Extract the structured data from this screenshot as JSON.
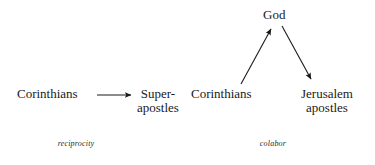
{
  "figure": {
    "width": 375,
    "height": 165,
    "background": "#ffffff",
    "text_color": "#1a1a1a"
  },
  "panels": [
    {
      "id": "reciprocity",
      "caption": "reciprocity",
      "nodes": {
        "source": "Corinthians",
        "target_line1": "Super-",
        "target_line2": "apostles"
      },
      "arrows": [
        {
          "name": "corinthians-to-superapostles",
          "from": [
            97,
            95
          ],
          "to": [
            133,
            95
          ],
          "direction": "right"
        }
      ]
    },
    {
      "id": "colabor",
      "caption": "colabor",
      "nodes": {
        "apex": "God",
        "source": "Corinthians",
        "target_line1": "Jerusalem",
        "target_line2": "apostles"
      },
      "arrows": [
        {
          "name": "corinthians-to-god",
          "from": [
            241,
            84
          ],
          "to": [
            272,
            27
          ],
          "direction": "up-right"
        },
        {
          "name": "god-to-jerusalem-apostles",
          "from": [
            282,
            26
          ],
          "to": [
            312,
            81
          ],
          "direction": "down-right"
        }
      ]
    }
  ]
}
